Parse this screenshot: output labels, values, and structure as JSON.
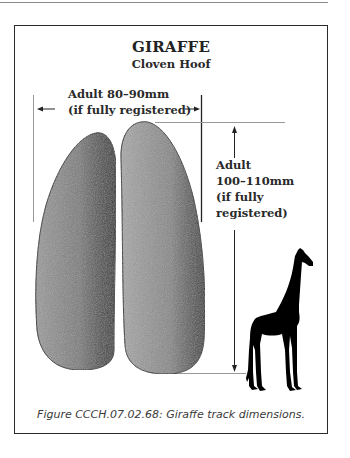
{
  "figure": {
    "title": "GIRAFFE",
    "subtitle": "Cloven Hoof",
    "width_label": {
      "line1": "Adult 80–90mm",
      "line2": "(if fully registered)"
    },
    "length_label": {
      "line1": "Adult",
      "line2": "100–110mm",
      "line3": "(if fully",
      "line4": "registered)"
    },
    "caption": "Figure CCCH.07.02.68:  Giraffe track dimensions.",
    "icons": [
      "left-arrow-icon",
      "right-arrow-icon",
      "up-arrow-icon",
      "down-arrow-icon",
      "giraffe-silhouette-icon",
      "hoof-print-left",
      "hoof-print-right"
    ],
    "colors": {
      "frame": "#2a2a2a",
      "hoof_light": "#b5b5b5",
      "hoof_dark": "#3a3a3a",
      "silhouette": "#000000"
    }
  }
}
